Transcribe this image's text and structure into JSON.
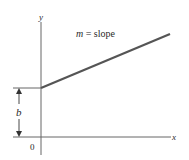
{
  "diagram": {
    "title_label": "m = slope",
    "slope_var": "m",
    "slope_eq": " = slope",
    "intercept_label": "b",
    "origin_label": "0",
    "x_axis_label": "x",
    "y_axis_label": "y",
    "colors": {
      "axis": "#555555",
      "line": "#555555",
      "text": "#2a2a2a"
    }
  }
}
